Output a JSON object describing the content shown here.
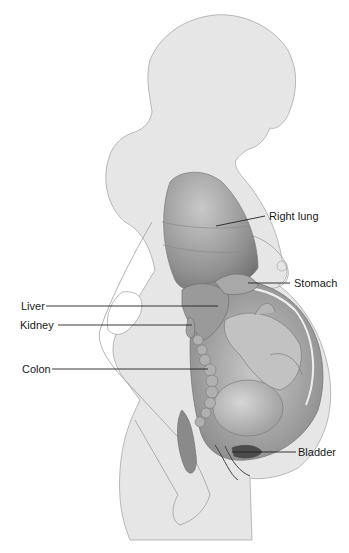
{
  "diagram": {
    "colors": {
      "body": "#e6e6e6",
      "outline": "#9a9a9a",
      "organ_dark": "#8a8a8a",
      "organ_mid": "#b4b4b4",
      "leader": "#222222",
      "text": "#1a1a1a"
    },
    "labels": [
      {
        "id": "right-lung",
        "text": "Right lung"
      },
      {
        "id": "stomach",
        "text": "Stomach"
      },
      {
        "id": "liver",
        "text": "Liver"
      },
      {
        "id": "kidney",
        "text": "Kidney"
      },
      {
        "id": "colon",
        "text": "Colon"
      },
      {
        "id": "bladder",
        "text": "Bladder"
      }
    ]
  }
}
